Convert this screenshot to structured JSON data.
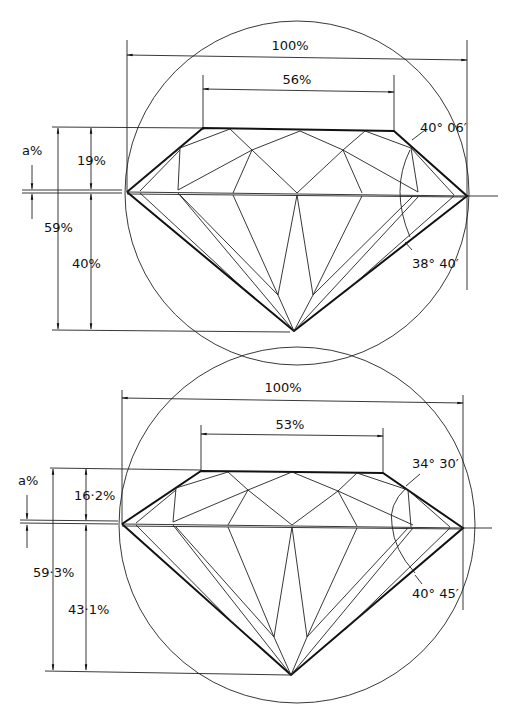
{
  "diagrams": [
    {
      "name": "brilliant-cut-proportions-1",
      "total_diameter_label": "100%",
      "table_label": "56%",
      "girdle_label": "a%",
      "crown_height_label": "19%",
      "total_depth_label": "59%",
      "pavilion_depth_label": "40%",
      "crown_angle_label": "40° 06′",
      "pavilion_angle_label": "38° 40′"
    },
    {
      "name": "brilliant-cut-proportions-2",
      "total_diameter_label": "100%",
      "table_label": "53%",
      "girdle_label": "a%",
      "crown_height_label": "16·2%",
      "total_depth_label": "59·3%",
      "pavilion_depth_label": "43·1%",
      "crown_angle_label": "34° 30′",
      "pavilion_angle_label": "40° 45′"
    }
  ]
}
